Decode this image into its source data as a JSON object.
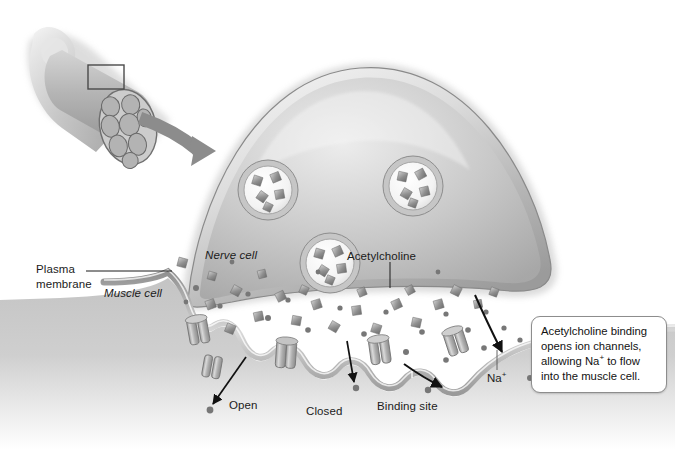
{
  "figure": {
    "background_color": "#ffffff",
    "ink_color": "#1b1b1b",
    "style": "grayscale medical illustration"
  },
  "labels": {
    "plasma_membrane": "Plasma\nmembrane",
    "muscle_cell": "Muscle cell",
    "nerve_cell": "Nerve cell",
    "acetylcholine": "Acetylcholine",
    "open": "Open",
    "closed": "Closed",
    "binding_site": "Binding site",
    "sodium_ion": "Na",
    "sodium_ion_charge": "+"
  },
  "callout": {
    "line1": "Acetylcholine binding",
    "line2": "opens ion channels,",
    "line3_pre": "allowing Na",
    "line3_sup": "+",
    "line3_post": " to flow",
    "line4": "into the muscle cell.",
    "border_color": "#8d8d8d",
    "fill_color": "#ffffff"
  },
  "inset": {
    "name": "muscle-fiber-bundle-inset",
    "description": "Cut muscle fiber bundle with highlighted region and arrow to magnified view",
    "arrow_color": "#8a8a8a",
    "highlight_box": "magnified-region"
  },
  "diagram_elements": {
    "vesicles": [
      {
        "name": "vesicle-1",
        "cx": 268,
        "cy": 190,
        "r": 30
      },
      {
        "name": "vesicle-2",
        "cx": 413,
        "cy": 186,
        "r": 30
      },
      {
        "name": "vesicle-3",
        "cx": 330,
        "cy": 263,
        "r": 30
      },
      {
        "name": "vesicle-fusing-left",
        "cx": 252,
        "cy": 300,
        "r": 27
      },
      {
        "name": "vesicle-fusing-right",
        "cx": 398,
        "cy": 296,
        "r": 27
      }
    ],
    "channels": [
      {
        "name": "channel-open-left",
        "x": 196,
        "y": 330,
        "state": "open"
      },
      {
        "name": "channel-closed-center",
        "x": 286,
        "y": 352,
        "state": "closed"
      },
      {
        "name": "channel-open-right",
        "x": 376,
        "y": 345,
        "state": "open"
      },
      {
        "name": "channel-far-right",
        "x": 452,
        "y": 338,
        "state": "open"
      }
    ],
    "arrows": [
      {
        "name": "arrow-open-channel",
        "direction": "down-left"
      },
      {
        "name": "arrow-closed-channel",
        "direction": "down"
      },
      {
        "name": "arrow-sodium-influx-1",
        "direction": "down-right"
      },
      {
        "name": "arrow-sodium-influx-2",
        "direction": "down-right"
      }
    ]
  }
}
